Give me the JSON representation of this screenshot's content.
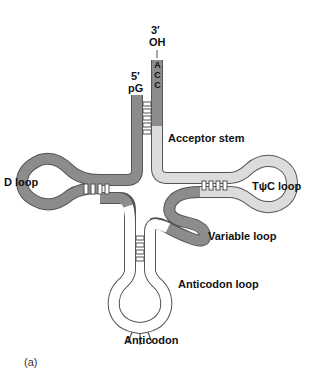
{
  "figure": {
    "panel_label": "(a)"
  },
  "labels": {
    "three_prime": "3′",
    "three_prime_group": "OH",
    "five_prime": "5′",
    "five_prime_group": "pG",
    "acceptor_stem": "Acceptor stem",
    "d_loop": "D loop",
    "tpsic_loop": "TψC loop",
    "variable_loop": "Variable loop",
    "anticodon_loop": "Anticodon loop",
    "anticodon": "Anticodon"
  },
  "sequence_tail": [
    "A",
    "C",
    "C"
  ],
  "colors": {
    "dark_strand": "#8c8c8c",
    "light_strand": "#dcdcdc",
    "white_strand": "#ffffff",
    "outline": "#555555",
    "text": "#111111"
  }
}
